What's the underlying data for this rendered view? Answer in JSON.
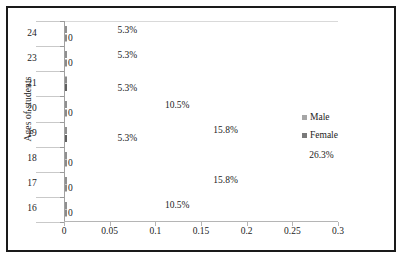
{
  "chart_data": {
    "type": "bar",
    "orientation": "horizontal",
    "title": "",
    "xlabel": "",
    "ylabel": "Ages of students",
    "xlim": [
      0,
      0.3
    ],
    "xticks": [
      "0",
      "0.05",
      "0.1",
      "0.15",
      "0.2",
      "0.25",
      "0.3"
    ],
    "xtick_values": [
      0,
      0.05,
      0.1,
      0.15,
      0.2,
      0.25,
      0.3
    ],
    "grid": false,
    "legend_position": "right",
    "categories": [
      "24",
      "23",
      "21",
      "20",
      "19",
      "18",
      "17",
      "16"
    ],
    "series": [
      {
        "name": "Male",
        "color": "#a6a6a6",
        "values": [
          0.053,
          0.053,
          0,
          0.105,
          0.158,
          0.263,
          0.158,
          0.105
        ],
        "labels": [
          "5.3%",
          "5.3%",
          "",
          "10.5%",
          "15.8%",
          "26.3%",
          "15.8%",
          "10.5%"
        ]
      },
      {
        "name": "Female",
        "color": "#7a7a7a",
        "values": [
          0,
          0,
          0.053,
          0,
          0.053,
          0,
          0,
          0
        ],
        "labels": [
          "0",
          "0",
          "5.3%",
          "0",
          "5.3%",
          "0",
          "0",
          "0"
        ]
      }
    ]
  },
  "legend": {
    "items": [
      {
        "label": "Male",
        "color": "#a6a6a6"
      },
      {
        "label": "Female",
        "color": "#7a7a7a"
      }
    ]
  }
}
